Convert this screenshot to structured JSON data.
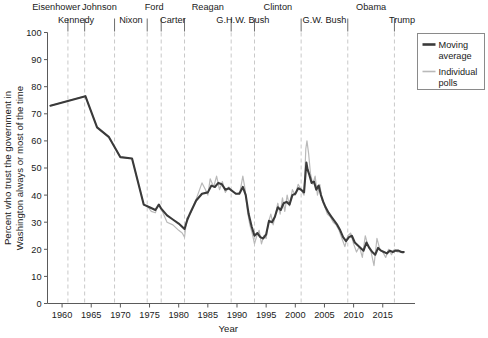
{
  "chart_data": {
    "type": "line",
    "title": "",
    "xlabel": "Year",
    "ylabel": "Percent who trust the government in Washington always or most of the time",
    "ylabel_line1": "Percent who trust the government in",
    "ylabel_line2": "Washington always or most of the time",
    "xlim": [
      1957.5,
      2019.5
    ],
    "ylim": [
      0,
      100
    ],
    "xticks": [
      1960,
      1965,
      1970,
      1975,
      1980,
      1985,
      1990,
      1995,
      2000,
      2005,
      2010,
      2015
    ],
    "yticks": [
      0,
      10,
      20,
      30,
      40,
      50,
      60,
      70,
      80,
      90,
      100
    ],
    "grid": false,
    "legend_position": "right",
    "legend": [
      {
        "name": "Moving average",
        "color": "#3a3a3a",
        "width": 2.2,
        "label_line1": "Moving",
        "label_line2": "average"
      },
      {
        "name": "Individual polls",
        "color": "#b9b9b9",
        "width": 1.2,
        "label_line1": "Individual",
        "label_line2": "polls"
      }
    ],
    "presidents": [
      {
        "name": "Eisenhower",
        "start": 1953,
        "end": 1961,
        "label_row": 0,
        "label_x": 1959.0
      },
      {
        "name": "Kennedy",
        "start": 1961,
        "end": 1963.87,
        "label_row": 1,
        "label_x": 1962.4
      },
      {
        "name": "Johnson",
        "start": 1963.87,
        "end": 1969,
        "label_row": 0,
        "label_x": 1966.4
      },
      {
        "name": "Nixon",
        "start": 1969,
        "end": 1974.6,
        "label_row": 1,
        "label_x": 1971.8
      },
      {
        "name": "Ford",
        "start": 1974.6,
        "end": 1977,
        "label_row": 0,
        "label_x": 1975.8
      },
      {
        "name": "Carter",
        "start": 1977,
        "end": 1981,
        "label_row": 1,
        "label_x": 1979.0
      },
      {
        "name": "Reagan",
        "start": 1981,
        "end": 1989,
        "label_row": 0,
        "label_x": 1985.0
      },
      {
        "name": "G.H.W. Bush",
        "start": 1989,
        "end": 1993,
        "label_row": 1,
        "label_x": 1991.0
      },
      {
        "name": "Clinton",
        "start": 1993,
        "end": 2001,
        "label_row": 0,
        "label_x": 1997.0
      },
      {
        "name": "G.W. Bush",
        "start": 2001,
        "end": 2009,
        "label_row": 1,
        "label_x": 2005.0
      },
      {
        "name": "Obama",
        "start": 2009,
        "end": 2017,
        "label_row": 0,
        "label_x": 2013.0
      },
      {
        "name": "Trump",
        "start": 2017,
        "end": 2019.5,
        "label_row": 1,
        "label_x": 2018.3
      }
    ],
    "series": [
      {
        "name": "Individual polls",
        "color": "#b9b9b9",
        "points": [
          [
            1958.0,
            73.0
          ],
          [
            1964.0,
            76.5
          ],
          [
            1966.0,
            65.0
          ],
          [
            1968.0,
            61.5
          ],
          [
            1970.0,
            54.0
          ],
          [
            1972.0,
            53.5
          ],
          [
            1974.0,
            36.5
          ],
          [
            1974.6,
            36.0
          ],
          [
            1975.3,
            34.0
          ],
          [
            1976.0,
            33.5
          ],
          [
            1976.5,
            36.5
          ],
          [
            1977.0,
            35.0
          ],
          [
            1978.0,
            30.0
          ],
          [
            1979.0,
            29.0
          ],
          [
            1980.0,
            27.0
          ],
          [
            1980.6,
            26.0
          ],
          [
            1981.0,
            24.5
          ],
          [
            1981.4,
            31.5
          ],
          [
            1982.0,
            33.0
          ],
          [
            1983.0,
            38.5
          ],
          [
            1984.0,
            44.5
          ],
          [
            1984.6,
            42.0
          ],
          [
            1985.0,
            40.0
          ],
          [
            1985.4,
            46.0
          ],
          [
            1986.0,
            43.0
          ],
          [
            1986.5,
            47.0
          ],
          [
            1987.0,
            42.0
          ],
          [
            1987.5,
            45.0
          ],
          [
            1988.0,
            41.0
          ],
          [
            1988.6,
            43.0
          ],
          [
            1989.0,
            41.5
          ],
          [
            1989.5,
            41.0
          ],
          [
            1990.0,
            40.5
          ],
          [
            1990.5,
            41.0
          ],
          [
            1991.0,
            47.0
          ],
          [
            1991.4,
            42.0
          ],
          [
            1991.8,
            34.0
          ],
          [
            1992.2,
            29.0
          ],
          [
            1992.6,
            26.0
          ],
          [
            1993.0,
            22.0
          ],
          [
            1993.4,
            25.0
          ],
          [
            1993.8,
            27.0
          ],
          [
            1994.2,
            22.0
          ],
          [
            1994.6,
            25.0
          ],
          [
            1995.0,
            24.0
          ],
          [
            1995.4,
            30.0
          ],
          [
            1995.8,
            33.0
          ],
          [
            1996.2,
            29.0
          ],
          [
            1996.6,
            33.0
          ],
          [
            1997.0,
            37.0
          ],
          [
            1997.4,
            33.0
          ],
          [
            1997.8,
            39.0
          ],
          [
            1998.2,
            34.0
          ],
          [
            1998.6,
            40.0
          ],
          [
            1999.0,
            36.0
          ],
          [
            1999.5,
            42.0
          ],
          [
            2000.0,
            40.0
          ],
          [
            2000.5,
            44.0
          ],
          [
            2001.0,
            42.0
          ],
          [
            2001.5,
            40.0
          ],
          [
            2001.8,
            57.0
          ],
          [
            2002.0,
            60.0
          ],
          [
            2002.3,
            55.0
          ],
          [
            2002.6,
            48.0
          ],
          [
            2003.0,
            44.0
          ],
          [
            2003.4,
            47.0
          ],
          [
            2003.8,
            40.0
          ],
          [
            2004.2,
            44.0
          ],
          [
            2004.6,
            38.0
          ],
          [
            2005.0,
            36.0
          ],
          [
            2005.5,
            33.0
          ],
          [
            2006.0,
            32.0
          ],
          [
            2006.5,
            30.0
          ],
          [
            2007.0,
            29.0
          ],
          [
            2007.5,
            27.0
          ],
          [
            2008.0,
            24.0
          ],
          [
            2008.5,
            21.0
          ],
          [
            2009.0,
            25.0
          ],
          [
            2009.5,
            26.0
          ],
          [
            2010.0,
            22.0
          ],
          [
            2010.5,
            19.0
          ],
          [
            2011.0,
            21.0
          ],
          [
            2011.5,
            17.0
          ],
          [
            2012.0,
            25.0
          ],
          [
            2012.5,
            21.0
          ],
          [
            2013.0,
            19.0
          ],
          [
            2013.5,
            14.0
          ],
          [
            2014.0,
            24.0
          ],
          [
            2014.5,
            20.0
          ],
          [
            2015.0,
            19.0
          ],
          [
            2015.5,
            17.0
          ],
          [
            2016.0,
            20.0
          ],
          [
            2016.5,
            18.0
          ],
          [
            2017.0,
            20.0
          ],
          [
            2017.5,
            19.0
          ],
          [
            2018.0,
            19.0
          ],
          [
            2018.5,
            18.5
          ]
        ]
      },
      {
        "name": "Moving average",
        "color": "#3a3a3a",
        "points": [
          [
            1958.0,
            73.0
          ],
          [
            1964.0,
            76.5
          ],
          [
            1966.0,
            65.0
          ],
          [
            1968.0,
            61.5
          ],
          [
            1970.0,
            54.0
          ],
          [
            1972.0,
            53.5
          ],
          [
            1974.0,
            36.5
          ],
          [
            1975.0,
            35.5
          ],
          [
            1976.0,
            34.5
          ],
          [
            1976.6,
            36.5
          ],
          [
            1977.0,
            35.0
          ],
          [
            1978.0,
            32.5
          ],
          [
            1979.0,
            31.0
          ],
          [
            1980.0,
            29.5
          ],
          [
            1980.5,
            28.5
          ],
          [
            1981.0,
            27.5
          ],
          [
            1981.5,
            31.0
          ],
          [
            1982.0,
            33.5
          ],
          [
            1983.0,
            38.0
          ],
          [
            1984.0,
            40.5
          ],
          [
            1985.0,
            41.0
          ],
          [
            1985.6,
            43.5
          ],
          [
            1986.2,
            43.0
          ],
          [
            1986.8,
            44.5
          ],
          [
            1987.4,
            44.0
          ],
          [
            1988.0,
            42.0
          ],
          [
            1988.6,
            42.5
          ],
          [
            1989.2,
            41.5
          ],
          [
            1989.8,
            40.5
          ],
          [
            1990.4,
            40.5
          ],
          [
            1991.0,
            43.0
          ],
          [
            1991.5,
            40.0
          ],
          [
            1992.0,
            33.0
          ],
          [
            1992.5,
            28.5
          ],
          [
            1993.0,
            25.0
          ],
          [
            1993.5,
            26.0
          ],
          [
            1994.0,
            24.5
          ],
          [
            1994.5,
            24.0
          ],
          [
            1995.0,
            25.5
          ],
          [
            1995.5,
            30.5
          ],
          [
            1996.0,
            30.0
          ],
          [
            1996.5,
            32.0
          ],
          [
            1997.0,
            35.5
          ],
          [
            1997.5,
            34.5
          ],
          [
            1998.0,
            37.0
          ],
          [
            1998.5,
            37.5
          ],
          [
            1999.0,
            36.5
          ],
          [
            1999.5,
            40.0
          ],
          [
            2000.0,
            40.5
          ],
          [
            2000.5,
            42.5
          ],
          [
            2001.0,
            42.0
          ],
          [
            2001.5,
            41.0
          ],
          [
            2001.9,
            52.0
          ],
          [
            2002.1,
            49.5
          ],
          [
            2002.4,
            47.5
          ],
          [
            2002.8,
            44.5
          ],
          [
            2003.2,
            45.0
          ],
          [
            2003.6,
            42.0
          ],
          [
            2004.0,
            43.5
          ],
          [
            2004.4,
            40.0
          ],
          [
            2004.8,
            37.5
          ],
          [
            2005.2,
            35.5
          ],
          [
            2005.7,
            33.5
          ],
          [
            2006.2,
            32.0
          ],
          [
            2006.7,
            30.5
          ],
          [
            2007.2,
            29.0
          ],
          [
            2007.7,
            27.0
          ],
          [
            2008.2,
            24.5
          ],
          [
            2008.7,
            23.0
          ],
          [
            2009.2,
            24.5
          ],
          [
            2009.7,
            25.0
          ],
          [
            2010.2,
            22.5
          ],
          [
            2010.7,
            21.5
          ],
          [
            2011.2,
            20.5
          ],
          [
            2011.7,
            19.5
          ],
          [
            2012.2,
            22.5
          ],
          [
            2012.7,
            20.5
          ],
          [
            2013.2,
            19.0
          ],
          [
            2013.7,
            18.0
          ],
          [
            2014.2,
            20.5
          ],
          [
            2014.7,
            19.5
          ],
          [
            2015.2,
            19.0
          ],
          [
            2015.7,
            18.5
          ],
          [
            2016.2,
            19.5
          ],
          [
            2016.7,
            19.0
          ],
          [
            2017.2,
            19.5
          ],
          [
            2017.7,
            19.5
          ],
          [
            2018.2,
            19.0
          ],
          [
            2018.6,
            19.0
          ]
        ]
      }
    ]
  }
}
